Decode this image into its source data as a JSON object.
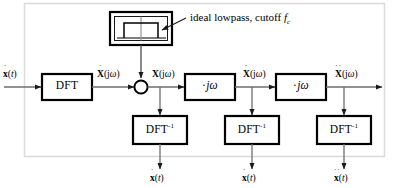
{
  "diagram": {
    "type": "signal-flow-block-diagram",
    "frame_color": "#dcdcdc",
    "line_color": "#4d4d4d",
    "block_border_color": "#000000",
    "text_color": "#000000",
    "background": "#ffffff"
  },
  "annotation": {
    "lowpass_note_pre": "ideal lowpass, cutoff ",
    "lowpass_note_symbol": "f",
    "lowpass_note_subscript": "c",
    "filter_icon_name": "ideal-lowpass-response-icon"
  },
  "blocks": {
    "dft": {
      "label": "DFT"
    },
    "multiplier_1": {
      "label_dot": "·",
      "label_j": "j",
      "label_omega": "ω"
    },
    "multiplier_2": {
      "label_dot": "·",
      "label_j": "j",
      "label_omega": "ω"
    },
    "idft_1": {
      "label_base": "DFT",
      "label_exp": "-1"
    },
    "idft_2": {
      "label_base": "DFT",
      "label_exp": "-1"
    },
    "idft_3": {
      "label_base": "DFT",
      "label_exp": "-1"
    },
    "junction": {
      "name": "multiplier-junction"
    }
  },
  "signals": {
    "input_time": {
      "dots": "˙",
      "symbol": "x",
      "args": "(",
      "var": "t",
      "close": ")"
    },
    "after_dft": {
      "dots": "˙",
      "symbol": "X",
      "open": "(j",
      "omega": "ω",
      "close": ")"
    },
    "after_filter": {
      "dots": "",
      "symbol": "X",
      "open": "(j",
      "omega": "ω",
      "close": ")"
    },
    "after_mult1": {
      "dots": "˙",
      "symbol": "X",
      "open": "(j",
      "omega": "ω",
      "close": ")"
    },
    "after_mult2": {
      "dots": "˙˙",
      "symbol": "X",
      "open": "(j",
      "omega": "ω",
      "close": ")"
    },
    "out_1": {
      "dots": "˙",
      "symbol": "x",
      "open": "(",
      "var": "t",
      "close": ")"
    },
    "out_2": {
      "dots": "˙",
      "symbol": "x",
      "open": "(",
      "var": "t",
      "close": ")"
    },
    "out_3": {
      "dots": "˙˙",
      "symbol": "x",
      "open": "(",
      "var": "t",
      "close": ")"
    }
  }
}
